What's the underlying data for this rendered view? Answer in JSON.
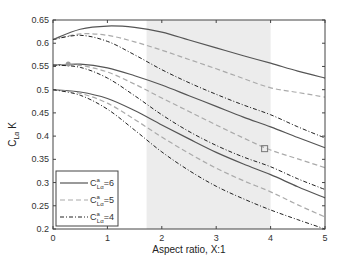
{
  "chart_data": {
    "type": "line",
    "title": "",
    "xlabel": "Aspect ratio, X:1",
    "ylabel": "C_Lα K",
    "xlim": [
      0,
      5
    ],
    "ylim": [
      0.2,
      0.65
    ],
    "xticks": [
      0,
      1,
      2,
      3,
      4,
      5
    ],
    "yticks": [
      0.2,
      0.25,
      0.3,
      0.35,
      0.4,
      0.45,
      0.5,
      0.55,
      0.6,
      0.65
    ],
    "grid": false,
    "shaded_region": {
      "x_start": 1.72,
      "x_end": 4.0,
      "color": "#ececec"
    },
    "legend_position": "lower left",
    "legend": [
      {
        "label": "C^a_Lα =6",
        "style": "solid",
        "color": "#555555"
      },
      {
        "label": "C^a_Lα =5",
        "style": "dashed",
        "color": "#aaaaaa"
      },
      {
        "label": "C^a_Lα =4",
        "style": "dashdot",
        "color": "#222222"
      }
    ],
    "x": [
      0,
      0.5,
      1,
      1.5,
      2,
      2.5,
      3,
      3.5,
      4,
      4.5,
      5
    ],
    "series": [
      {
        "name": "C^a_Lα=6 (group 1)",
        "style": "solid",
        "values": [
          0.608,
          0.63,
          0.637,
          0.634,
          0.624,
          0.607,
          0.59,
          0.573,
          0.557,
          0.54,
          0.525
        ]
      },
      {
        "name": "C^a_Lα=5 (group 1)",
        "style": "dashed",
        "values": [
          0.608,
          0.62,
          0.617,
          0.603,
          0.585,
          0.565,
          0.545,
          0.524,
          0.504,
          0.494,
          0.484
        ]
      },
      {
        "name": "C^a_Lα=4 (group 1)",
        "style": "dashdot",
        "values": [
          0.608,
          0.617,
          0.604,
          0.575,
          0.543,
          0.515,
          0.49,
          0.467,
          0.446,
          0.42,
          0.396
        ]
      },
      {
        "name": "C^a_Lα=6 (group 2)",
        "style": "solid",
        "values": [
          0.553,
          0.555,
          0.547,
          0.53,
          0.51,
          0.487,
          0.464,
          0.441,
          0.42,
          0.397,
          0.375
        ]
      },
      {
        "name": "C^a_Lα=5 (group 2)",
        "style": "dashed",
        "values": [
          0.553,
          0.552,
          0.538,
          0.512,
          0.482,
          0.453,
          0.424,
          0.396,
          0.37,
          0.351,
          0.332
        ]
      },
      {
        "name": "C^a_Lα=4 (group 2)",
        "style": "dashdot",
        "values": [
          0.553,
          0.548,
          0.525,
          0.487,
          0.446,
          0.41,
          0.38,
          0.355,
          0.334,
          0.308,
          0.285
        ]
      },
      {
        "name": "C^a_Lα=6 (group 3)",
        "style": "solid",
        "values": [
          0.5,
          0.495,
          0.481,
          0.455,
          0.424,
          0.394,
          0.365,
          0.34,
          0.317,
          0.291,
          0.267
        ]
      },
      {
        "name": "C^a_Lα=5 (group 3)",
        "style": "dashed",
        "values": [
          0.5,
          0.492,
          0.471,
          0.436,
          0.398,
          0.363,
          0.331,
          0.304,
          0.28,
          0.252,
          0.226
        ]
      },
      {
        "name": "C^a_Lα=4 (group 3)",
        "style": "dashdot",
        "values": [
          0.5,
          0.488,
          0.458,
          0.413,
          0.366,
          0.326,
          0.292,
          0.265,
          0.241,
          0.22,
          0.2
        ]
      }
    ],
    "markers": [
      {
        "shape": "circle",
        "x": 0.28,
        "y": 0.555
      },
      {
        "shape": "square",
        "x": 3.89,
        "y": 0.373
      }
    ]
  }
}
